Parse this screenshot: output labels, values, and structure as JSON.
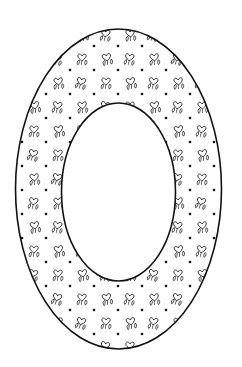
{
  "image": {
    "title": "Letter O coloring page",
    "description": "Outlined letter O ring filled with a pattern of small hearts with leaves and dots",
    "colors": {
      "background": "#ffffff",
      "stroke": "#111111",
      "fill": "#ffffff"
    },
    "shape": "letter-o",
    "pattern": {
      "motif": "heart-with-leaves",
      "accent": "dot"
    }
  }
}
